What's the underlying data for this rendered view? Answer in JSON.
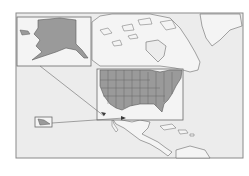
{
  "map": {
    "title": "",
    "description": "Locator map of North America highlighting the United States with Alaska and Hawaii insets",
    "colors": {
      "background": "#ffffff",
      "ocean": "#ececec",
      "land": "#f4f4f4",
      "highlight": "#9a9a9a",
      "border": "#6a6a6a",
      "frame": "#8a8a8a"
    },
    "regions": [
      {
        "name": "Alaska",
        "role": "inset",
        "highlighted": true
      },
      {
        "name": "Contiguous United States",
        "role": "inset",
        "highlighted": true
      },
      {
        "name": "Hawaii",
        "role": "inset",
        "highlighted": true
      },
      {
        "name": "Canada",
        "highlighted": false
      },
      {
        "name": "Greenland",
        "highlighted": false
      },
      {
        "name": "Mexico",
        "highlighted": false
      },
      {
        "name": "Central America",
        "highlighted": false
      },
      {
        "name": "Caribbean",
        "highlighted": false
      }
    ],
    "insets": [
      {
        "name": "alaska-inset",
        "box": [
          17,
          17,
          74,
          49
        ]
      },
      {
        "name": "contiguous-us-inset",
        "box": [
          97,
          69,
          86,
          51
        ]
      },
      {
        "name": "hawaii-inset",
        "box": [
          35,
          117,
          17,
          10
        ]
      }
    ],
    "leader_lines": [
      {
        "from": "alaska-inset",
        "to": [
          105,
          116
        ]
      },
      {
        "from": "hawaii-inset",
        "to": [
          124,
          118
        ]
      }
    ]
  }
}
